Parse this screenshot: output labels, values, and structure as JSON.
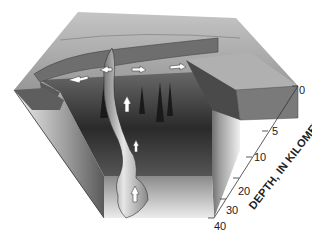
{
  "diagram": {
    "type": "3D block diagram (cutaway)",
    "axis": {
      "title": "DEPTH, IN KILOMETERS",
      "ticks": [
        "0",
        "5",
        "10",
        "20",
        "30",
        "40"
      ],
      "unit": "kilometers"
    },
    "colors": {
      "background": "#ffffff",
      "surface_top": "#a8a8a8",
      "upper_layer": "#6e6e6e",
      "block_side_light": "#d8d8d8",
      "block_side_dark": "#3c3c3c",
      "magma_body": "#bdbdbd",
      "arrow_fill": "#ffffff"
    },
    "features": [
      "surface topography with small cones",
      "dark upper crustal layer",
      "vertical magma conduit",
      "white flow arrows (lateral near surface, upward in conduit)",
      "irregular deep magma body at base",
      "depth scale on right edge"
    ]
  }
}
